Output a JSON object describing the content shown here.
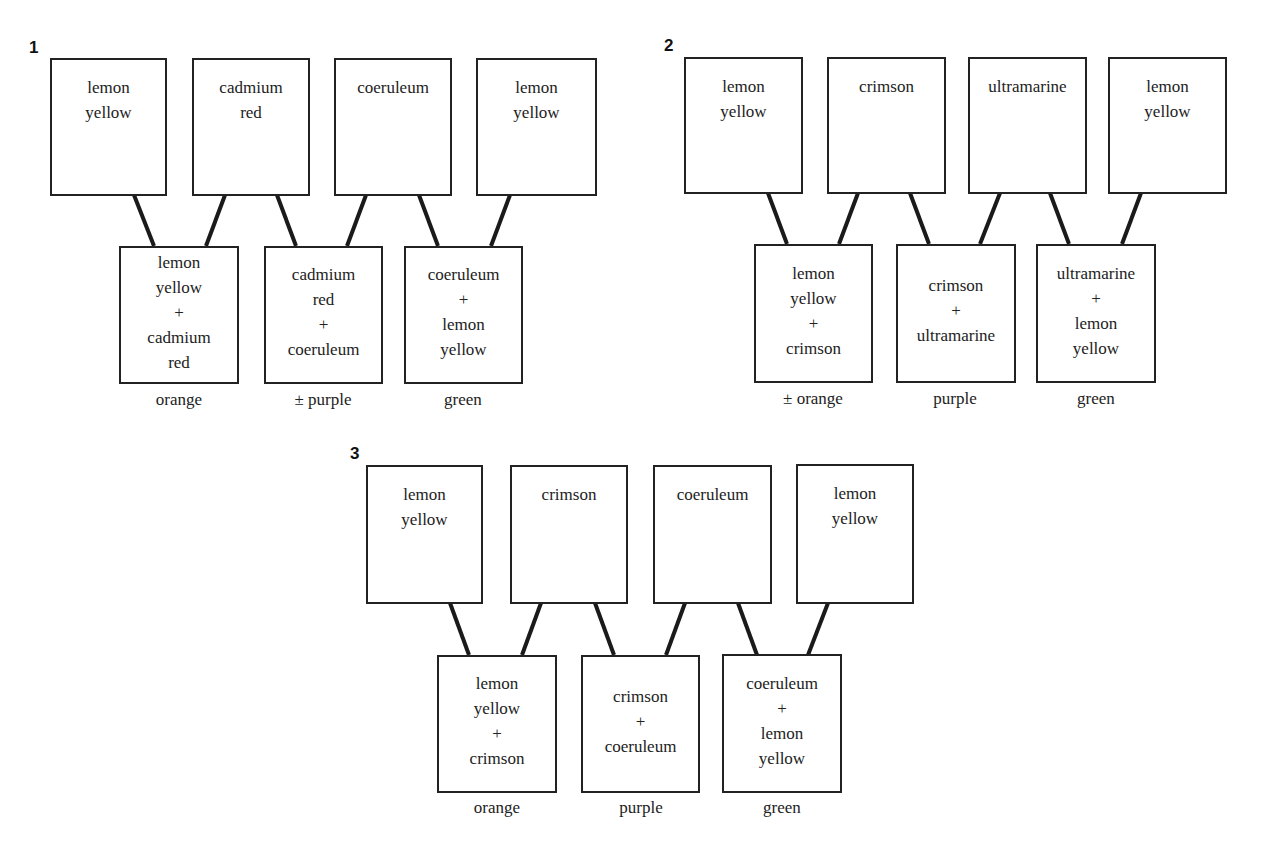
{
  "diagram": {
    "panels": [
      {
        "number": "1",
        "top": [
          "lemon\nyellow",
          "cadmium\nred",
          "coeruleum",
          "lemon\nyellow"
        ],
        "mixes": [
          "lemon\nyellow\n+\ncadmium\nred",
          "cadmium\nred\n+\ncoeruleum",
          "coeruleum\n+\nlemon\nyellow"
        ],
        "results": [
          "orange",
          "± purple",
          "green"
        ]
      },
      {
        "number": "2",
        "top": [
          "lemon\nyellow",
          "crimson",
          "ultramarine",
          "lemon\nyellow"
        ],
        "mixes": [
          "lemon\nyellow\n+\ncrimson",
          "crimson\n+\nultramarine",
          "ultramarine\n+\nlemon\nyellow"
        ],
        "results": [
          "± orange",
          "purple",
          "green"
        ]
      },
      {
        "number": "3",
        "top": [
          "lemon\nyellow",
          "crimson",
          "coeruleum",
          "lemon\nyellow"
        ],
        "mixes": [
          "lemon\nyellow\n+\ncrimson",
          "crimson\n+\ncoeruleum",
          "coeruleum\n+\nlemon\nyellow"
        ],
        "results": [
          "orange",
          "purple",
          "green"
        ]
      }
    ]
  }
}
